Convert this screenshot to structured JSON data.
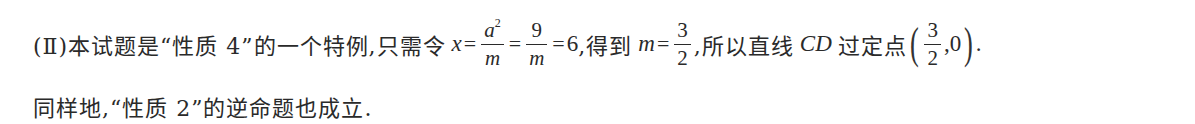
{
  "line1": {
    "prefix": "(Ⅱ)本试题是“性质 4”的一个特例,只需令",
    "var_x": "x",
    "eq1": "=",
    "frac1": {
      "numerator": "a",
      "numerator_sup": "2",
      "denominator": "m"
    },
    "eq2": "=",
    "frac2": {
      "numerator": "9",
      "denominator": "m"
    },
    "eq3": "=",
    "value": "6",
    "mid_text": ",得到",
    "var_m": "m",
    "eq4": "=",
    "frac3": {
      "numerator": "3",
      "denominator": "2"
    },
    "after_text": ",所以直线",
    "line_name": "CD",
    "point_text": "过定点",
    "point": {
      "open": "(",
      "x_frac": {
        "numerator": "3",
        "denominator": "2"
      },
      "sep": ",",
      "y": "0",
      "close": ")"
    },
    "end": "."
  },
  "line2": {
    "text": "同样地,“性质 2”的逆命题也成立."
  }
}
